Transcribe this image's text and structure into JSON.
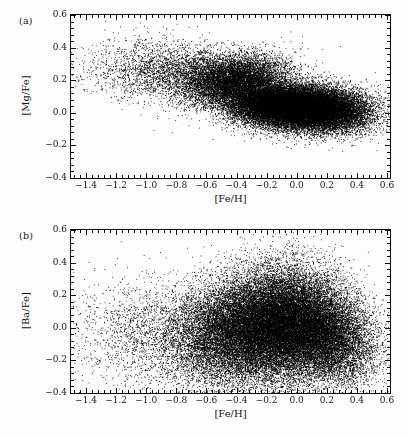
{
  "figure": {
    "background_color": "#fdfdfd",
    "ink_color": "#0d0d0d",
    "width": 408,
    "height": 438
  },
  "chart_data": [
    {
      "type": "scatter",
      "panel_tag": "(a)",
      "title": "",
      "xlabel": "[Fe/H]",
      "ylabel": "[Mg/Fe]",
      "xlim": [
        -1.5,
        0.62
      ],
      "ylim": [
        -0.4,
        0.6
      ],
      "xticks": [
        -1.4,
        -1.2,
        -1.0,
        -0.8,
        -0.6,
        -0.4,
        -0.2,
        0.0,
        0.2,
        0.4,
        0.6
      ],
      "xticklabels": [
        "−1.4",
        "−1.2",
        "−1.0",
        "−0.8",
        "−0.6",
        "−0.4",
        "−0.2",
        "0.0",
        "0.2",
        "0.4",
        "0.6"
      ],
      "yticks": [
        -0.4,
        -0.2,
        0.0,
        0.2,
        0.4,
        0.6
      ],
      "yticklabels": [
        "−0.4",
        "−0.2",
        "0.0",
        "0.2",
        "0.4",
        "0.6"
      ],
      "minor_ticks_per_major_x": 5,
      "minor_ticks_per_major_y": 5,
      "tick_direction": "in",
      "grid": false,
      "legend": null,
      "marker": "point",
      "marker_size_px": 1,
      "marker_color": "#000000",
      "n_points": 42000,
      "description": "Dense elongated cloud of stars; high-alpha sequence near [Mg/Fe]=0.25 at low [Fe/H] merging into thin-disc locus near [Mg/Fe]=0.02 for [Fe/H] > -0.3",
      "density_components": [
        {
          "name": "metal-poor-halo-thick-disc",
          "weight": 0.07,
          "x_mean": -0.85,
          "x_sigma": 0.26,
          "y_mean": 0.26,
          "y_sigma": 0.085,
          "slope": -0.02
        },
        {
          "name": "thick-disc-alpha-rich",
          "weight": 0.2,
          "x_mean": -0.42,
          "x_sigma": 0.18,
          "y_mean": 0.2,
          "y_sigma": 0.075,
          "slope": 0.1
        },
        {
          "name": "thin-disc-core",
          "weight": 0.52,
          "x_mean": -0.08,
          "x_sigma": 0.18,
          "y_mean": 0.04,
          "y_sigma": 0.065,
          "slope": -0.08
        },
        {
          "name": "metal-rich-tail",
          "weight": 0.21,
          "x_mean": 0.22,
          "x_sigma": 0.15,
          "y_mean": 0.02,
          "y_sigma": 0.07,
          "slope": -0.05
        }
      ]
    },
    {
      "type": "scatter",
      "panel_tag": "(b)",
      "title": "",
      "xlabel": "[Fe/H]",
      "ylabel": "[Ba/Fe]",
      "xlim": [
        -1.5,
        0.62
      ],
      "ylim": [
        -0.4,
        0.6
      ],
      "xticks": [
        -1.4,
        -1.2,
        -1.0,
        -0.8,
        -0.6,
        -0.4,
        -0.2,
        0.0,
        0.2,
        0.4,
        0.6
      ],
      "xticklabels": [
        "−1.4",
        "−1.2",
        "−1.0",
        "−0.8",
        "−0.6",
        "−0.4",
        "−0.2",
        "0.0",
        "0.2",
        "0.4",
        "0.6"
      ],
      "yticks": [
        -0.4,
        -0.2,
        0.0,
        0.2,
        0.4,
        0.6
      ],
      "yticklabels": [
        "−0.4",
        "−0.2",
        "0.0",
        "0.2",
        "0.4",
        "0.6"
      ],
      "minor_ticks_per_major_x": 5,
      "minor_ticks_per_major_y": 5,
      "tick_direction": "in",
      "grid": false,
      "legend": null,
      "marker": "point",
      "marker_size_px": 1,
      "marker_color": "#000000",
      "n_points": 42000,
      "description": "Broad triangular plume peaking near [Fe/H]=-0.15 with large vertical scatter in [Ba/Fe] from -0.35 to 0.6, thinning toward both metallicity extremes",
      "density_components": [
        {
          "name": "metal-poor-sparse",
          "weight": 0.05,
          "x_mean": -0.95,
          "x_sigma": 0.28,
          "y_mean": -0.02,
          "y_sigma": 0.16,
          "slope": 0.0
        },
        {
          "name": "intermediate-plume",
          "weight": 0.24,
          "x_mean": -0.45,
          "x_sigma": 0.2,
          "y_mean": -0.02,
          "y_sigma": 0.16,
          "slope": 0.1
        },
        {
          "name": "main-peak",
          "weight": 0.48,
          "x_mean": -0.12,
          "x_sigma": 0.19,
          "y_mean": 0.02,
          "y_sigma": 0.17,
          "slope": 0.05
        },
        {
          "name": "metal-rich-tail",
          "weight": 0.23,
          "x_mean": 0.2,
          "x_sigma": 0.16,
          "y_mean": -0.05,
          "y_sigma": 0.14,
          "slope": -0.1
        }
      ]
    }
  ],
  "panels": [
    {
      "id": "panel-a",
      "tag": "(a)",
      "xlabel": "[Fe/H]",
      "ylabel": "[Mg/Fe]",
      "ylabel_numerator": "Mg",
      "ylabel_denominator": "Fe",
      "xlabel_numerator": "Fe",
      "xlabel_denominator": "H"
    },
    {
      "id": "panel-b",
      "tag": "(b)",
      "xlabel": "[Fe/H]",
      "ylabel": "[Ba/Fe]",
      "ylabel_numerator": "Ba",
      "ylabel_denominator": "Fe",
      "xlabel_numerator": "Fe",
      "xlabel_denominator": "H"
    }
  ]
}
